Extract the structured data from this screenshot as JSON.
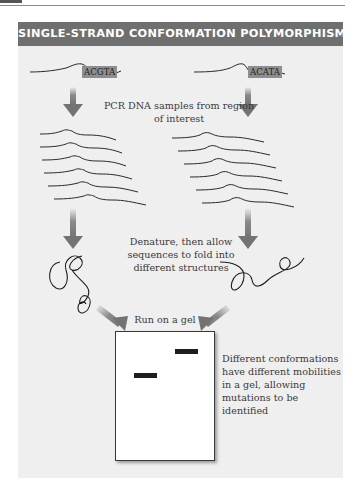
{
  "header": {
    "title": "SINGLE-STRAND CONFORMATION POLYMORPHISM"
  },
  "samples": [
    {
      "sequence": "ACGTA"
    },
    {
      "sequence": "ACATA"
    }
  ],
  "steps": {
    "pcr": "PCR DNA samples from region of interest",
    "pcr_line1": "PCR DNA samples from region",
    "pcr_line2": "of interest",
    "denature_line1": "Denature, then allow",
    "denature_line2": "sequences to fold into",
    "denature_line3": "different structures",
    "gel_label": "Run on a gel",
    "result_line1": "Different conformations",
    "result_line2": "have different mobilities",
    "result_line3": "in a gel, allowing",
    "result_line4": "mutations to be identified"
  },
  "colors": {
    "header_bg": "#6f6f6f",
    "panel_bg": "#efefef",
    "arrow": "#7a7a7a",
    "band": "#1e1e1e"
  }
}
